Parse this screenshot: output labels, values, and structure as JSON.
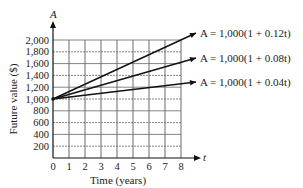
{
  "chart_data": {
    "type": "line",
    "title": "",
    "xlabel": "Time (years)",
    "ylabel": "Future value ($)",
    "x_axis_var": "t",
    "y_axis_var": "A",
    "xlim": [
      0,
      8
    ],
    "ylim": [
      0,
      2000
    ],
    "x_ticks": [
      "0",
      "1",
      "2",
      "3",
      "4",
      "5",
      "6",
      "7",
      "8"
    ],
    "y_ticks": [
      "200",
      "400",
      "600",
      "800",
      "1,000",
      "1,200",
      "1,400",
      "1,600",
      "1,800",
      "2,000"
    ],
    "grid": true,
    "legend_position": "right, inline labels at line ends",
    "x": [
      0,
      8
    ],
    "series": [
      {
        "name": "A = 1,000(1 + 0.12t)",
        "values": [
          1000,
          1960
        ]
      },
      {
        "name": "A = 1,000(1 + 0.08t)",
        "values": [
          1000,
          1640
        ]
      },
      {
        "name": "A = 1,000(1 + 0.04t)",
        "values": [
          1000,
          1320
        ]
      }
    ]
  },
  "labels": {
    "y_axis_var": "A",
    "x_axis_var": "t",
    "xlabel": "Time (years)",
    "ylabel": "Future value ($)",
    "origin": "0",
    "eq1": "A = 1,000(1 + 0.12t)",
    "eq2": "A = 1,000(1 + 0.08t)",
    "eq3": "A = 1,000(1 + 0.04t)"
  }
}
